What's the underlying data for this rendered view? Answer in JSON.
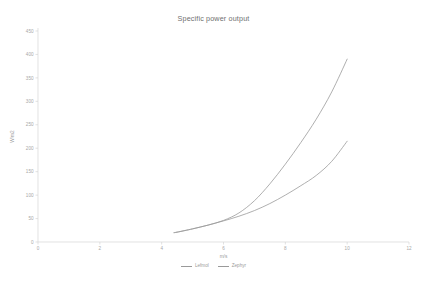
{
  "chart_data": {
    "type": "line",
    "title": "Specific power output",
    "xlabel": "m/s",
    "ylabel": "W/m2",
    "xlim": [
      0,
      12
    ],
    "ylim": [
      0,
      450
    ],
    "xticks": [
      "0",
      "2",
      "4",
      "6",
      "8",
      "10",
      "12"
    ],
    "yticks": [
      "0",
      "50",
      "100",
      "150",
      "200",
      "250",
      "300",
      "350",
      "400",
      "450"
    ],
    "grid": false,
    "legend_position": "bottom",
    "x": [
      4.4,
      4.5,
      5,
      5.5,
      6,
      6.5,
      7,
      7.5,
      8,
      8.5,
      9,
      9.5,
      10
    ],
    "series": [
      {
        "name": "Lefmol",
        "color": "#9a9a9a",
        "values": [
          20,
          21,
          28,
          36,
          46,
          62,
          88,
          124,
          166,
          212,
          262,
          320,
          390
        ]
      },
      {
        "name": "Zephyr",
        "color": "#9a9a9a",
        "values": [
          20,
          21,
          28,
          36,
          45,
          55,
          67,
          82,
          100,
          120,
          142,
          172,
          215
        ]
      }
    ]
  },
  "legend": {
    "entries": [
      {
        "label": "Lefmol"
      },
      {
        "label": "Zephyr"
      }
    ]
  }
}
